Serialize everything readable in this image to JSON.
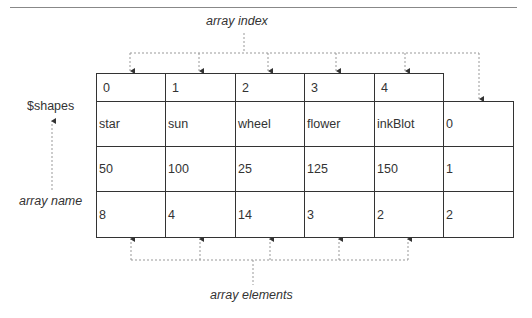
{
  "diagram": {
    "labels": {
      "array_index": "array index",
      "array_name": "array name",
      "array_elements": "array elements",
      "variable": "$shapes"
    },
    "index_row": [
      "0",
      "1",
      "2",
      "3",
      "4"
    ],
    "rows": [
      [
        "star",
        "sun",
        "wheel",
        "flower",
        "inkBlot",
        "0"
      ],
      [
        "50",
        "100",
        "25",
        "125",
        "150",
        "1"
      ],
      [
        "8",
        "4",
        "14",
        "3",
        "2",
        "2"
      ]
    ]
  }
}
